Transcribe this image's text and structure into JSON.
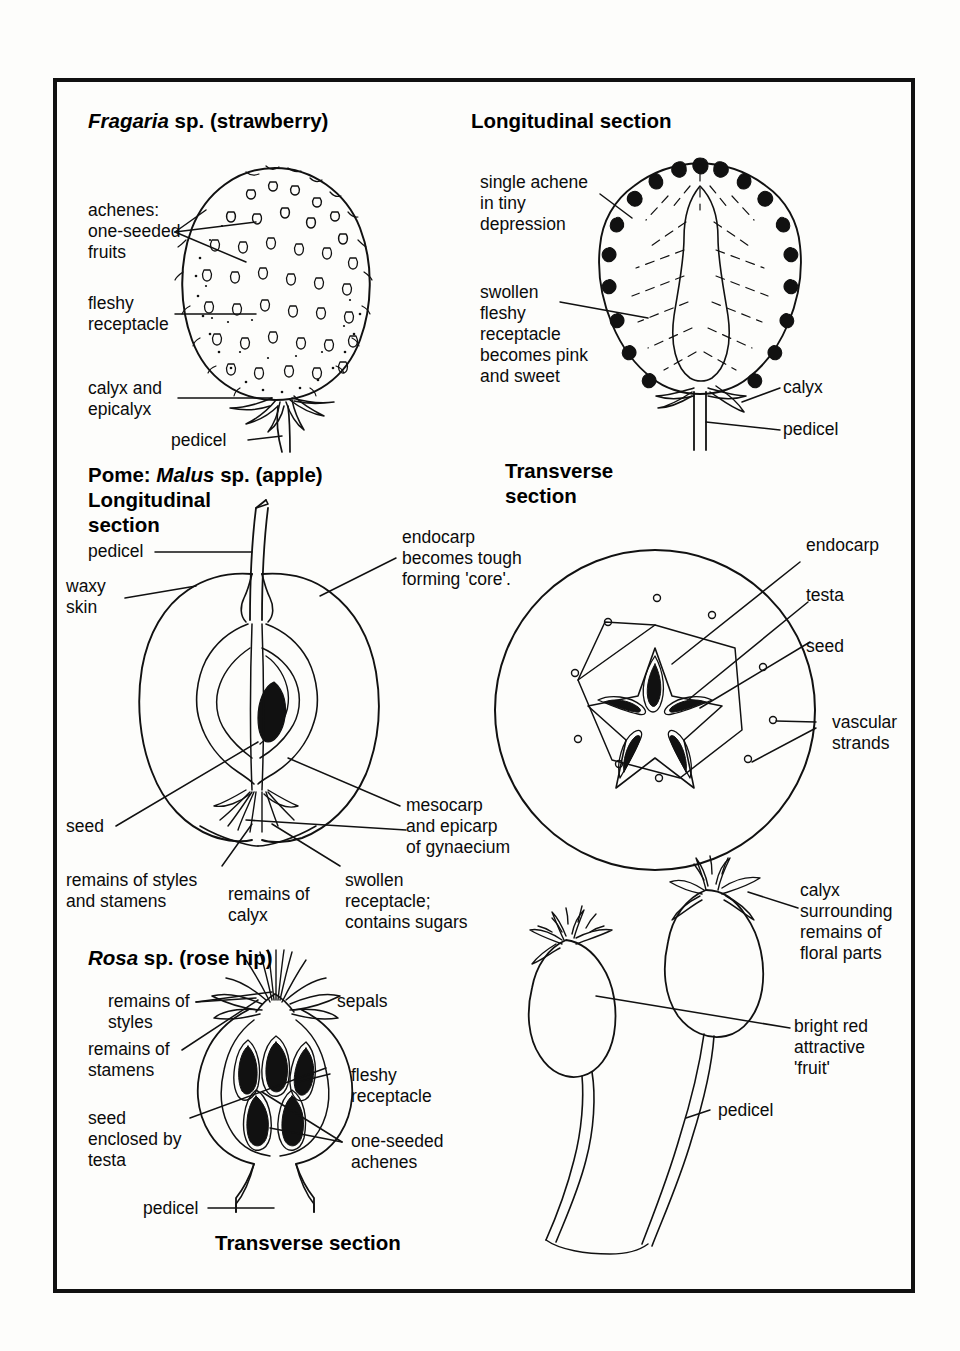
{
  "plate": {
    "border_color": "#111111",
    "background": "#fdfdfb",
    "ink": "#0b0b0b"
  },
  "headings": {
    "fragaria": {
      "genus": "Fragaria",
      "rest": " sp. (strawberry)"
    },
    "longitudinal_section": "Longitudinal section",
    "pome": {
      "prefix": "Pome: ",
      "genus": "Malus",
      "rest": " sp. (apple)"
    },
    "pome_ls_line2": "Longitudinal",
    "pome_ls_line3": "section",
    "transverse_section_apple_l1": "Transverse",
    "transverse_section_apple_l2": "section",
    "rosa": {
      "genus": "Rosa",
      "rest": " sp. (rose hip)"
    },
    "transverse_section_rose": "Transverse section"
  },
  "labels": {
    "strawberry": {
      "achenes": "achenes:\none-seeded\nfruits",
      "fleshy_receptacle": "fleshy\nreceptacle",
      "calyx_and_epicalyx": "calyx and\nepicalyx",
      "pedicel": "pedicel"
    },
    "strawberry_ls": {
      "single_achene": "single achene\nin tiny\ndepression",
      "swollen_receptacle": "swollen\nfleshy\nreceptacle\nbecomes pink\nand sweet",
      "calyx": "calyx",
      "pedicel": "pedicel"
    },
    "apple_ls": {
      "pedicel": "pedicel",
      "waxy_skin": "waxy\nskin",
      "seed": "seed",
      "endocarp": "endocarp\nbecomes tough\nforming 'core'.",
      "mesocarp": "mesocarp\nand epicarp\nof gynaecium",
      "remains_styles_stamens": "remains of styles\nand stamens",
      "remains_calyx": "remains of\ncalyx",
      "swollen_receptacle": "swollen\nreceptacle;\ncontains sugars"
    },
    "apple_ts": {
      "endocarp": "endocarp",
      "testa": "testa",
      "seed": "seed",
      "vascular_strands": "vascular\nstrands"
    },
    "rose_ts": {
      "remains_of_styles": "remains of\nstyles",
      "remains_of_stamens": "remains of\nstamens",
      "seed_enclosed": "seed\nenclosed by\ntesta",
      "pedicel": "pedicel",
      "sepals": "sepals",
      "fleshy_receptacle": "fleshy\nreceptacle",
      "one_seeded_achenes": "one-seeded\nachenes"
    },
    "rose_hips": {
      "calyx_surrounding": "calyx\nsurrounding\nremains of\nfloral parts",
      "bright_red": "bright red\nattractive\n'fruit'",
      "pedicel": "pedicel"
    }
  }
}
